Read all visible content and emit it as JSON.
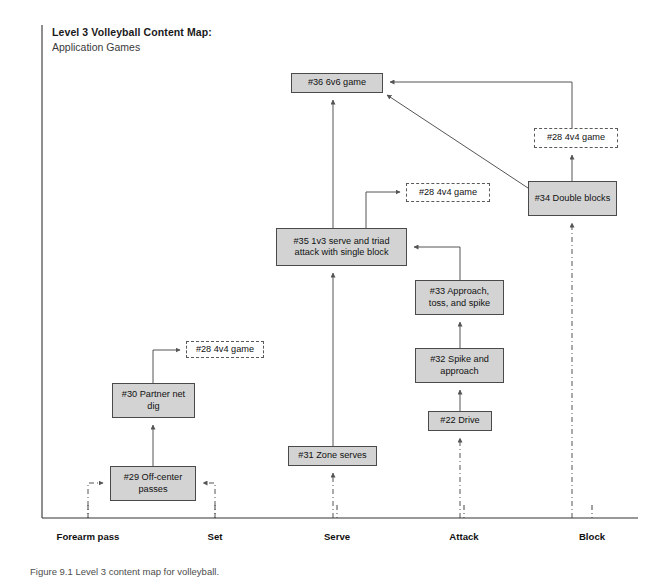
{
  "title": {
    "line1": "Level 3 Volleyball Content Map:",
    "line2": "Application Games"
  },
  "caption": "Figure 9.1   Level 3 content map for volleyball.",
  "colors": {
    "node_fill": "#d3d3d3",
    "node_border": "#4a4a4a",
    "dashed_border": "#5a5a5a",
    "connector": "#555555",
    "axis": "#333333",
    "text": "#111111"
  },
  "nodes": [
    {
      "id": "n36",
      "label": "#36 6v6 game",
      "style": "solid",
      "x": 291,
      "y": 73,
      "w": 92,
      "h": 20
    },
    {
      "id": "n28c",
      "label": "#28 4v4 game",
      "style": "dashed",
      "x": 534,
      "y": 128,
      "w": 84,
      "h": 20
    },
    {
      "id": "n34",
      "label": "#34 Double blocks",
      "style": "solid",
      "x": 528,
      "y": 181,
      "w": 89,
      "h": 35
    },
    {
      "id": "n28b",
      "label": "#28 4v4 game",
      "style": "dashed",
      "x": 406,
      "y": 183,
      "w": 84,
      "h": 19
    },
    {
      "id": "n35",
      "label": "#35 1v3 serve and triad attack with single block",
      "style": "solid",
      "x": 276,
      "y": 228,
      "w": 131,
      "h": 38
    },
    {
      "id": "n33",
      "label": "#33 Approach, toss, and spike",
      "style": "solid",
      "x": 415,
      "y": 280,
      "w": 89,
      "h": 35
    },
    {
      "id": "n28a",
      "label": "#28 4v4 game",
      "style": "dashed",
      "x": 186,
      "y": 341,
      "w": 78,
      "h": 17
    },
    {
      "id": "n32",
      "label": "#32 Spike and approach",
      "style": "solid",
      "x": 415,
      "y": 348,
      "w": 89,
      "h": 35
    },
    {
      "id": "n30",
      "label": "#30 Partner net dig",
      "style": "solid",
      "x": 112,
      "y": 383,
      "w": 83,
      "h": 35
    },
    {
      "id": "n22",
      "label": "#22 Drive",
      "style": "solid",
      "x": 428,
      "y": 411,
      "w": 64,
      "h": 20
    },
    {
      "id": "n31",
      "label": "#31 Zone serves",
      "style": "solid",
      "x": 288,
      "y": 446,
      "w": 89,
      "h": 20
    },
    {
      "id": "n29",
      "label": "#29 Off-center passes",
      "style": "solid",
      "x": 110,
      "y": 466,
      "w": 86,
      "h": 35
    }
  ],
  "axis": {
    "y": 518,
    "x_start": 42,
    "x_end": 638,
    "vertical_x": 42,
    "vertical_top": 25,
    "ticks": [
      {
        "label": "Forearm pass",
        "x": 88
      },
      {
        "label": "Set",
        "x": 215
      },
      {
        "label": "Serve",
        "x": 337
      },
      {
        "label": "Attack",
        "x": 464
      },
      {
        "label": "Block",
        "x": 592
      }
    ],
    "label_y": 531
  },
  "connectors": [
    {
      "from": "axis-forearm",
      "to": "n29",
      "kind": "dashdot"
    },
    {
      "from": "axis-set",
      "to": "n29",
      "kind": "dashdot"
    },
    {
      "from": "n29",
      "to": "n30",
      "kind": "solid"
    },
    {
      "from": "n30",
      "to": "n28a",
      "kind": "solid"
    },
    {
      "from": "axis-serve",
      "to": "n31",
      "kind": "dashdot"
    },
    {
      "from": "n31",
      "to": "n36",
      "kind": "solid"
    },
    {
      "from": "n35",
      "to": "n28b",
      "kind": "solid"
    },
    {
      "from": "n33",
      "to": "n35",
      "kind": "solid"
    },
    {
      "from": "n32",
      "to": "n33",
      "kind": "solid"
    },
    {
      "from": "n22",
      "to": "n32",
      "kind": "solid"
    },
    {
      "from": "axis-attack",
      "to": "n22",
      "kind": "dashdot"
    },
    {
      "from": "axis-block",
      "to": "n34",
      "kind": "dashdot"
    },
    {
      "from": "n34",
      "to": "n28c",
      "kind": "solid"
    },
    {
      "from": "n28c",
      "to": "n36",
      "kind": "solid"
    },
    {
      "from": "n34",
      "to": "n36",
      "kind": "solid"
    }
  ]
}
